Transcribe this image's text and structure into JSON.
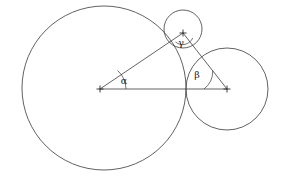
{
  "figure": {
    "background_color": "#ffffff",
    "stroke_color": "#3a3a3a",
    "label_color": "#1a1a1a"
  },
  "circles": [
    {
      "name": "large-circle",
      "cx": 104,
      "cy": 88,
      "r": 82,
      "vertex_label": "alpha"
    },
    {
      "name": "right-circle",
      "cx": 227,
      "cy": 89,
      "r": 41,
      "vertex_label": "beta"
    },
    {
      "name": "small-top-circle",
      "cx": 183,
      "cy": 29,
      "r": 19,
      "vertex_label": "gamma"
    }
  ],
  "vertices": [
    {
      "name": "vertex-alpha",
      "x": 100,
      "y": 89,
      "label": "α",
      "label_x": 124,
      "label_y": 84
    },
    {
      "name": "vertex-beta",
      "x": 227,
      "y": 89,
      "label": "β",
      "label_x": 197,
      "label_y": 78
    },
    {
      "name": "vertex-gamma",
      "x": 183,
      "y": 33,
      "label": "γ",
      "label_x": 180,
      "label_y": 46
    }
  ],
  "triangle": {
    "name": "centers-triangle",
    "sides": [
      {
        "name": "side-alpha-beta",
        "x1": 100,
        "y1": 89,
        "x2": 227,
        "y2": 89
      },
      {
        "name": "side-alpha-gamma",
        "x1": 100,
        "y1": 89,
        "x2": 183,
        "y2": 33
      },
      {
        "name": "side-beta-gamma",
        "x1": 227,
        "y1": 89,
        "x2": 183,
        "y2": 33
      }
    ]
  },
  "angle_arcs": [
    {
      "name": "arc-alpha",
      "d": "M 126 89 A 26 26 0 0 0 117.6 70.5"
    },
    {
      "name": "arc-beta",
      "d": "M 204 89 A 23 23 0 0 0 212.8 70.7"
    },
    {
      "name": "arc-gamma",
      "d": "M 175.5 42.0 A 11 11 0 0 0 192.7 38.0"
    }
  ],
  "labels": {
    "alpha": "α",
    "beta": "β",
    "gamma": "γ"
  }
}
